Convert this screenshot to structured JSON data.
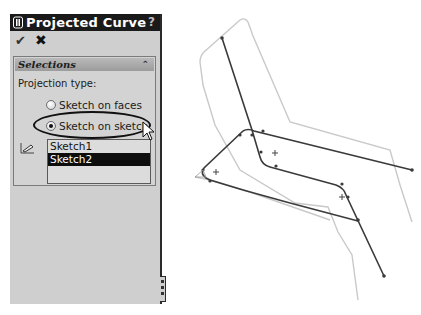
{
  "panel": {
    "title": "Projected Curve",
    "help_label": "?",
    "icons": {
      "title_icon": "projected-curve-icon",
      "ok": "checkmark-icon",
      "cancel": "close-icon"
    },
    "ok_glyph": "✔",
    "cancel_glyph": "✖",
    "selections": {
      "title": "Selections",
      "collapse_glyph": "⌃",
      "projection_type_label": "Projection type:",
      "options": [
        {
          "label": "Sketch on faces",
          "selected": false
        },
        {
          "label": "Sketch on sketch",
          "selected": true
        }
      ],
      "list_icon": "sketch-selection-icon",
      "list_items": [
        {
          "label": "Sketch1",
          "selected": false
        },
        {
          "label": "Sketch2",
          "selected": true
        }
      ]
    }
  },
  "colors": {
    "titlebar": "#1a1a1a",
    "panel_bg": "#cfcfcf",
    "selected_item_bg": "#0d0d0d",
    "curve": "#333333",
    "silhouette": "#c8c8c8"
  }
}
